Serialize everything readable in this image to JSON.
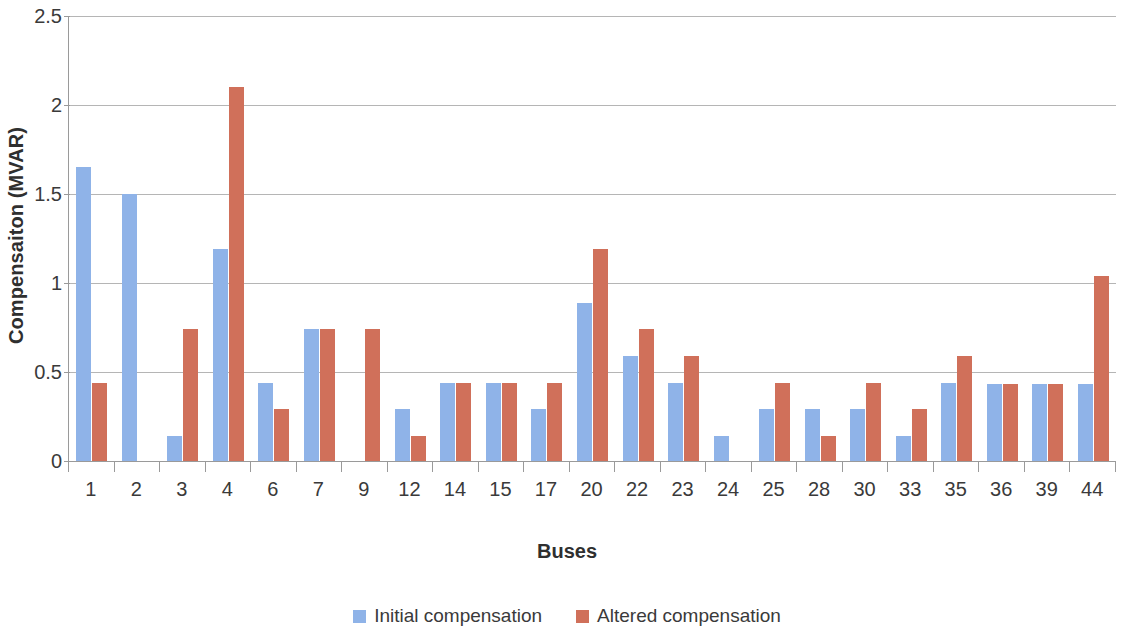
{
  "chart_data": {
    "type": "bar",
    "title": "",
    "xlabel": "Buses",
    "ylabel": "Compensaiton (MVAR)",
    "ylim": [
      0,
      2.5
    ],
    "y_ticks": [
      "0",
      "0.5",
      "1",
      "1.5",
      "2",
      "2.5"
    ],
    "y_tick_values": [
      0,
      0.5,
      1,
      1.5,
      2,
      2.5
    ],
    "grid": true,
    "legend_position": "bottom",
    "categories": [
      "1",
      "2",
      "3",
      "4",
      "6",
      "7",
      "9",
      "12",
      "14",
      "15",
      "17",
      "20",
      "22",
      "23",
      "24",
      "25",
      "28",
      "30",
      "33",
      "35",
      "36",
      "39",
      "44"
    ],
    "series": [
      {
        "name": "Initial compensation",
        "color": "#8FB3E8",
        "values": [
          1.65,
          1.5,
          0.14,
          1.19,
          0.44,
          0.74,
          0,
          0.29,
          0.44,
          0.44,
          0.29,
          0.89,
          0.59,
          0.44,
          0.14,
          0.29,
          0.29,
          0.29,
          0.14,
          0.44,
          0.43,
          0.43,
          0.43
        ]
      },
      {
        "name": "Altered compensation",
        "color": "#D0705A",
        "values": [
          0.44,
          0,
          0.74,
          2.1,
          0.29,
          0.74,
          0.74,
          0.14,
          0.44,
          0.44,
          0.44,
          1.19,
          0.74,
          0.59,
          0,
          0.44,
          0.14,
          0.44,
          0.29,
          0.59,
          0.43,
          0.43,
          1.04
        ]
      }
    ]
  },
  "axes": {
    "y_title": "Compensaiton (MVAR)",
    "x_title": "Buses"
  },
  "legend": {
    "items": [
      {
        "label": "Initial compensation",
        "color": "#8FB3E8"
      },
      {
        "label": "Altered compensation",
        "color": "#D0705A"
      }
    ]
  }
}
